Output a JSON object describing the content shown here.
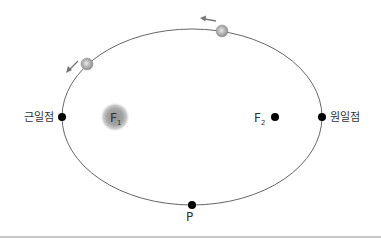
{
  "diagram": {
    "labels": {
      "perihelion": "근일점",
      "aphelion": "원일점",
      "focus1_main": "F",
      "focus1_sub": "1",
      "focus2_main": "F",
      "focus2_sub": "2",
      "point_p": "P"
    },
    "colors": {
      "orbit": "#666666",
      "point": "#000000",
      "sun_outer": "#c9c9c9",
      "sun_inner": "#9a9a9a",
      "planet": "#a8a8a8",
      "arrow": "#777777",
      "text": "#333333",
      "rule": "#c8c8c8"
    },
    "icons": {
      "sun": "sun-focus-icon",
      "planet": "planet-icon",
      "direction": "arrow-icon"
    },
    "orbit_direction": "counterclockwise"
  }
}
